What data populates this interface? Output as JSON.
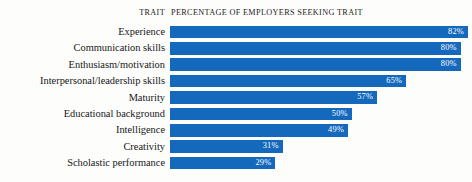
{
  "header": {
    "trait_label": "TRAIT",
    "percentage_label": "PERCENTAGE OF EMPLOYERS SEEKING TRAIT"
  },
  "style": {
    "bar_color": "#1569bd",
    "value_text_color": "#ffffff",
    "label_text_color": "#16181a",
    "background_color": "#fdfdfb"
  },
  "chart_data": {
    "type": "bar",
    "orientation": "horizontal",
    "title": "PERCENTAGE OF EMPLOYERS SEEKING TRAIT",
    "xlabel": "",
    "ylabel": "TRAIT",
    "xlim": [
      0,
      82
    ],
    "grid": false,
    "legend": false,
    "value_suffix": "%",
    "categories": [
      "Experience",
      "Communication skills",
      "Enthusiasm/motivation",
      "Interpersonal/leadership skills",
      "Maturity",
      "Educational background",
      "Intelligence",
      "Creativity",
      "Scholastic performance"
    ],
    "values": [
      82,
      80,
      80,
      65,
      57,
      50,
      49,
      31,
      29
    ],
    "value_labels": [
      "82%",
      "80%",
      "80%",
      "65%",
      "57%",
      "50%",
      "49%",
      "31%",
      "29%"
    ]
  }
}
